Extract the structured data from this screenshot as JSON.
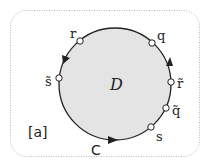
{
  "figure": {
    "tag": "[a]",
    "region_label": "D",
    "curve_label": "C",
    "colors": {
      "frame": "#b8b8b8",
      "region_fill": "#e4e4e4",
      "curve": "#222222",
      "point_fill": "#ffffff"
    },
    "points": [
      {
        "id": "r",
        "label": "r"
      },
      {
        "id": "q",
        "label": "q"
      },
      {
        "id": "s-tilde",
        "label": "s̃"
      },
      {
        "id": "r-tilde",
        "label": "r̃"
      },
      {
        "id": "q-tilde",
        "label": "q̃"
      },
      {
        "id": "s",
        "label": "s"
      }
    ],
    "orientation": "counterclockwise"
  }
}
